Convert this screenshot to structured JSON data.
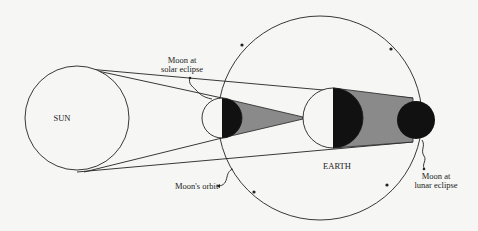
{
  "diagram": {
    "labels": {
      "sun": "SUN",
      "earth": "EARTH",
      "moon_solar_line1": "Moon at",
      "moon_solar_line2": "solar eclipse",
      "moon_lunar_line1": "Moon at",
      "moon_lunar_line2": "lunar eclipse",
      "orbit": "Moon's orbit"
    },
    "colors": {
      "background": "#f6f6f4",
      "stroke": "#222222",
      "umbra": "#111111",
      "penumbra_shadow": "#8a8a8a"
    },
    "bodies": [
      {
        "name": "Sun",
        "cx": 77,
        "cy": 118,
        "r": 52
      },
      {
        "name": "Moon (solar eclipse)",
        "cx": 222,
        "cy": 118,
        "r": 20
      },
      {
        "name": "Earth",
        "cx": 333,
        "cy": 118,
        "r": 30
      },
      {
        "name": "Moon (lunar eclipse)",
        "cx": 416,
        "cy": 120,
        "r": 19
      },
      {
        "name": "Moon's orbit",
        "cx": 320,
        "cy": 118,
        "r": 102
      }
    ]
  }
}
